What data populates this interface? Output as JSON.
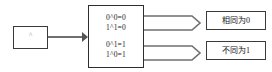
{
  "diagram": {
    "operator_box": {
      "symbol": "^"
    },
    "truth_table": {
      "group_same": [
        "0^0=0",
        "1^1=0"
      ],
      "group_diff": [
        "0^1=1",
        "1^0=1"
      ]
    },
    "results": [
      {
        "label": "相同为0"
      },
      {
        "label": "不同为1"
      }
    ],
    "colors": {
      "stroke": "#3a3a3a",
      "arrow": "#6f6f6f",
      "text": "#1c1c1c",
      "background": "#ffffff"
    }
  }
}
